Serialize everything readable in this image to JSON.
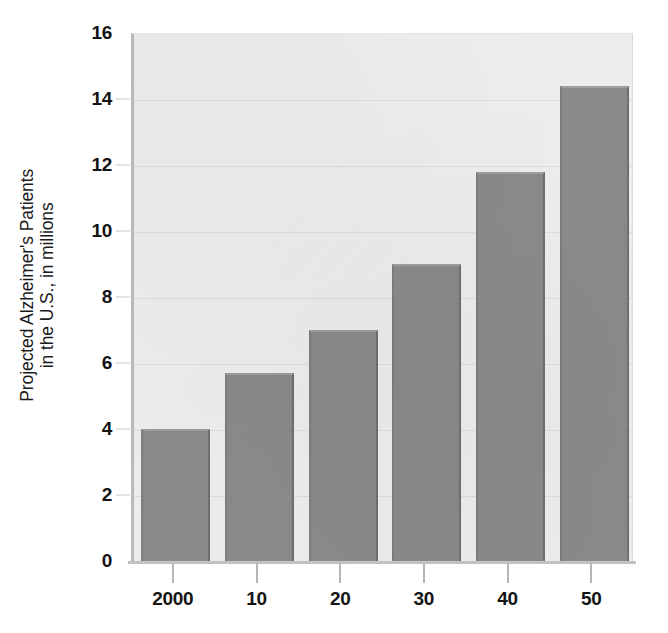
{
  "chart_data": {
    "type": "bar",
    "title": "",
    "subtitle": "",
    "xlabel": "",
    "ylabel": "Projected Alzheimer's Patients in the U.S., in millions",
    "ylabel_lines": [
      "Projected Alzheimer's Patients",
      "in the U.S., in millions"
    ],
    "categories": [
      "2000",
      "10",
      "20",
      "30",
      "40",
      "50"
    ],
    "values": [
      4.0,
      5.7,
      7.0,
      9.0,
      11.8,
      14.4
    ],
    "ylim": [
      0,
      16
    ],
    "ytick_values": [
      0,
      2,
      4,
      6,
      8,
      10,
      12,
      14,
      16
    ],
    "ytick_labels": [
      "0",
      "2",
      "4",
      "6",
      "8",
      "10",
      "12",
      "14",
      "16"
    ],
    "grid": true,
    "grid_axis": "y",
    "legend": false,
    "legend_position": "none",
    "bar_color": "#8a8a8a",
    "plot_background": "#ededed",
    "gridline_color": "#dcdcdc",
    "axis_color": "#b9b9b9",
    "text_color": "#141414",
    "figure_background": "#ffffff"
  }
}
